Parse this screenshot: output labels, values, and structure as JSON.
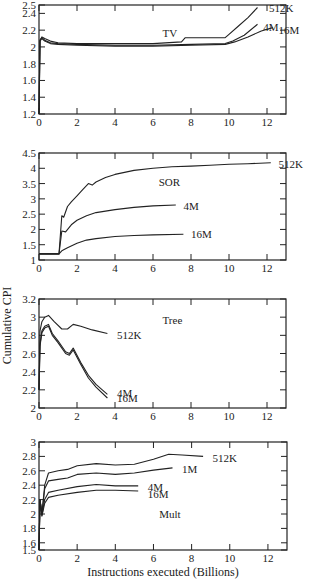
{
  "figure": {
    "ylabel": "Cumulative CPI",
    "xlabel": "Instructions executed (Billions)"
  },
  "chart_data": [
    {
      "type": "line",
      "title": "TV",
      "xlabel": "Instructions executed (Billions)",
      "ylabel": "Cumulative CPI",
      "xlim": [
        0,
        13
      ],
      "ylim": [
        1.2,
        2.5
      ],
      "xticks": [
        0,
        2,
        4,
        6,
        8,
        10,
        12
      ],
      "yticks": [
        1.2,
        1.4,
        1.6,
        1.8,
        2,
        2.2,
        2.4,
        2.5
      ],
      "ytick_labels": [
        "1.2",
        "1.4",
        "1.6",
        "1.8",
        "2",
        "2.2",
        "2.4",
        "2.5"
      ],
      "series": [
        {
          "name": "512K",
          "x": [
            0,
            0.05,
            0.15,
            0.3,
            0.6,
            1,
            2,
            4,
            6,
            7.5,
            7.7,
            8.5,
            9.8,
            10,
            10.5,
            11,
            11.5
          ],
          "y": [
            1.2,
            2.08,
            2.12,
            2.1,
            2.07,
            2.05,
            2.04,
            2.04,
            2.04,
            2.06,
            2.11,
            2.11,
            2.11,
            2.15,
            2.25,
            2.35,
            2.47
          ]
        },
        {
          "name": "4M",
          "x": [
            0,
            0.05,
            0.15,
            0.3,
            0.6,
            1,
            2,
            4,
            6,
            8,
            9.8,
            10.2,
            10.8,
            11.5
          ],
          "y": [
            1.2,
            2.08,
            2.11,
            2.08,
            2.05,
            2.04,
            2.03,
            2.02,
            2.02,
            2.03,
            2.04,
            2.07,
            2.14,
            2.27
          ]
        },
        {
          "name": "16M",
          "x": [
            0,
            0.05,
            0.15,
            0.3,
            0.6,
            1,
            2,
            4,
            6,
            8,
            9.8,
            10.3,
            11,
            11.7,
            12.3
          ],
          "y": [
            1.2,
            2.07,
            2.1,
            2.07,
            2.04,
            2.03,
            2.02,
            2.01,
            2.01,
            2.02,
            2.03,
            2.06,
            2.12,
            2.19,
            2.23
          ]
        }
      ],
      "labels": [
        {
          "text": "512K",
          "x": 12.1,
          "y": 2.47
        },
        {
          "text": "4M",
          "x": 11.8,
          "y": 2.24
        },
        {
          "text": "16M",
          "x": 12.6,
          "y": 2.2
        },
        {
          "text": "TV",
          "x": 6.5,
          "y": 2.17
        }
      ]
    },
    {
      "type": "line",
      "title": "SOR",
      "xlim": [
        0,
        13
      ],
      "ylim": [
        1,
        4.5
      ],
      "xticks": [
        0,
        2,
        4,
        6,
        8,
        10,
        12
      ],
      "yticks": [
        1,
        1.5,
        2,
        2.5,
        3,
        3.5,
        4,
        4.5
      ],
      "ytick_labels": [
        "1",
        "1.5",
        "2",
        "2.5",
        "3",
        "3.5",
        "4",
        "4.5"
      ],
      "series": [
        {
          "name": "512K",
          "x": [
            0,
            1.05,
            1.2,
            1.3,
            1.5,
            1.7,
            2,
            2.3,
            2.6,
            2.8,
            3,
            3.5,
            4,
            5,
            6,
            7,
            8,
            9,
            10,
            11,
            12.2
          ],
          "y": [
            1.2,
            1.2,
            2.45,
            2.4,
            2.75,
            2.9,
            3.1,
            3.3,
            3.5,
            3.45,
            3.55,
            3.7,
            3.8,
            3.93,
            4.0,
            4.05,
            4.07,
            4.1,
            4.13,
            4.15,
            4.18
          ]
        },
        {
          "name": "4M",
          "x": [
            0,
            1.05,
            1.2,
            1.4,
            1.7,
            2,
            2.5,
            3,
            4,
            5,
            6,
            7.2
          ],
          "y": [
            1.2,
            1.2,
            1.95,
            1.92,
            2.15,
            2.3,
            2.45,
            2.55,
            2.65,
            2.72,
            2.77,
            2.8
          ]
        },
        {
          "name": "16M",
          "x": [
            0,
            1.05,
            1.2,
            1.5,
            2,
            2.5,
            3,
            4,
            5,
            6,
            7.6
          ],
          "y": [
            1.2,
            1.2,
            1.3,
            1.4,
            1.55,
            1.65,
            1.7,
            1.77,
            1.8,
            1.82,
            1.84
          ]
        }
      ],
      "labels": [
        {
          "text": "512K",
          "x": 12.6,
          "y": 4.15
        },
        {
          "text": "4M",
          "x": 7.6,
          "y": 2.78
        },
        {
          "text": "16M",
          "x": 8.0,
          "y": 1.84
        },
        {
          "text": "SOR",
          "x": 6.3,
          "y": 3.55
        }
      ]
    },
    {
      "type": "line",
      "title": "Tree",
      "xlim": [
        0,
        13
      ],
      "ylim": [
        2,
        3.2
      ],
      "xticks": [
        0,
        2,
        4,
        6,
        8,
        10,
        12
      ],
      "yticks": [
        2,
        2.2,
        2.4,
        2.6,
        2.8,
        3,
        3.2
      ],
      "ytick_labels": [
        "2",
        "2.2",
        "2.4",
        "2.6",
        "2.8",
        "3",
        "3.2"
      ],
      "series": [
        {
          "name": "512K",
          "x": [
            0,
            0.05,
            0.15,
            0.3,
            0.5,
            0.8,
            1.2,
            1.5,
            1.8,
            2.2,
            2.8,
            3.6
          ],
          "y": [
            2.2,
            2.85,
            2.95,
            3.0,
            3.02,
            2.95,
            2.87,
            2.87,
            2.92,
            2.9,
            2.86,
            2.82
          ]
        },
        {
          "name": "4M",
          "x": [
            0,
            0.05,
            0.15,
            0.3,
            0.5,
            0.7,
            1.0,
            1.4,
            1.6,
            1.8,
            2.2,
            2.6,
            3.0,
            3.6
          ],
          "y": [
            2.2,
            2.7,
            2.85,
            2.9,
            2.92,
            2.82,
            2.74,
            2.62,
            2.6,
            2.66,
            2.5,
            2.36,
            2.26,
            2.15
          ]
        },
        {
          "name": "16M",
          "x": [
            0,
            0.05,
            0.15,
            0.3,
            0.5,
            0.7,
            1.0,
            1.4,
            1.6,
            1.8,
            2.2,
            2.6,
            3.0,
            3.6
          ],
          "y": [
            2.2,
            2.68,
            2.83,
            2.88,
            2.9,
            2.8,
            2.72,
            2.6,
            2.58,
            2.64,
            2.48,
            2.33,
            2.23,
            2.11
          ]
        }
      ],
      "labels": [
        {
          "text": "512K",
          "x": 4.1,
          "y": 2.8
        },
        {
          "text": "4M",
          "x": 4.1,
          "y": 2.17
        },
        {
          "text": "16M",
          "x": 4.1,
          "y": 2.11
        },
        {
          "text": "Tree",
          "x": 6.5,
          "y": 2.97
        }
      ]
    },
    {
      "type": "line",
      "title": "Mult",
      "xlim": [
        0,
        13
      ],
      "ylim": [
        1.5,
        3
      ],
      "xticks": [
        0,
        2,
        4,
        6,
        8,
        10,
        12
      ],
      "yticks": [
        1.5,
        1.6,
        1.8,
        2,
        2.2,
        2.4,
        2.6,
        2.8,
        3
      ],
      "ytick_labels": [
        "1.5",
        "1.6",
        "1.8",
        "2",
        "2.2",
        "2.4",
        "2.6",
        "2.8",
        "3"
      ],
      "series": [
        {
          "name": "512K",
          "x": [
            0,
            0.05,
            0.15,
            0.3,
            0.5,
            1,
            1.5,
            2,
            3,
            4,
            5,
            6,
            6.8,
            7.5,
            8.6
          ],
          "y": [
            1.5,
            2.2,
            2.0,
            2.4,
            2.57,
            2.6,
            2.62,
            2.67,
            2.7,
            2.68,
            2.69,
            2.76,
            2.83,
            2.82,
            2.8
          ]
        },
        {
          "name": "1M",
          "x": [
            0,
            0.05,
            0.15,
            0.3,
            0.5,
            1,
            1.5,
            2,
            3,
            4,
            5,
            6,
            7
          ],
          "y": [
            1.5,
            2.2,
            2.0,
            2.35,
            2.46,
            2.48,
            2.5,
            2.55,
            2.57,
            2.55,
            2.57,
            2.61,
            2.64
          ]
        },
        {
          "name": "4M",
          "x": [
            0,
            0.05,
            0.15,
            0.3,
            0.5,
            1,
            2,
            3,
            4,
            5.2
          ],
          "y": [
            1.5,
            2.2,
            1.98,
            2.2,
            2.3,
            2.33,
            2.38,
            2.41,
            2.39,
            2.39
          ]
        },
        {
          "name": "16M",
          "x": [
            0,
            0.05,
            0.15,
            0.3,
            0.5,
            1,
            2,
            3,
            4,
            5.2
          ],
          "y": [
            1.5,
            2.2,
            1.97,
            2.15,
            2.23,
            2.26,
            2.3,
            2.33,
            2.33,
            2.32
          ]
        }
      ],
      "labels": [
        {
          "text": "512K",
          "x": 9.1,
          "y": 2.78
        },
        {
          "text": "1M",
          "x": 7.5,
          "y": 2.62
        },
        {
          "text": "4M",
          "x": 5.7,
          "y": 2.38
        },
        {
          "text": "16M",
          "x": 5.7,
          "y": 2.28
        },
        {
          "text": "Mult",
          "x": 6.3,
          "y": 2.0
        }
      ]
    }
  ],
  "panels_px": [
    {
      "left": 39,
      "right": 286,
      "top": 5,
      "bottom": 114
    },
    {
      "left": 39,
      "right": 286,
      "top": 153,
      "bottom": 260
    },
    {
      "left": 39,
      "right": 286,
      "top": 299,
      "bottom": 408
    },
    {
      "left": 39,
      "right": 287,
      "top": 442,
      "bottom": 550
    }
  ]
}
